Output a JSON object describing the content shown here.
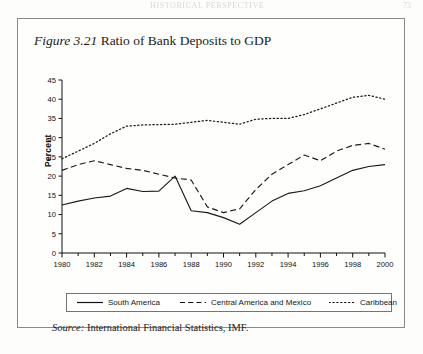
{
  "page": {
    "running_head": "HISTORICAL  PERSPECTIVE",
    "page_number": "73"
  },
  "figure": {
    "label": "Figure 3.21",
    "title": "Ratio of Bank Deposits to GDP",
    "source_label": "Source:",
    "source_text": "International Financial Statistics, IMF."
  },
  "legend": {
    "items": [
      {
        "label": "South America",
        "style": "solid",
        "key": "line-solid-key"
      },
      {
        "label": "Central America and Mexico",
        "style": "dashed",
        "key": "line-dashed-key"
      },
      {
        "label": "Caribbean",
        "style": "dotted",
        "key": "line-dotted-key"
      }
    ]
  },
  "chart_data": {
    "type": "line",
    "title": "Ratio of Bank Deposits to GDP",
    "xlabel": "",
    "ylabel": "Percent",
    "xlim": [
      1980,
      2000
    ],
    "ylim": [
      0,
      45
    ],
    "ytick_step": 5,
    "yticks": [
      0,
      5,
      10,
      15,
      20,
      25,
      30,
      35,
      40,
      45
    ],
    "xticks": [
      1980,
      1982,
      1984,
      1986,
      1988,
      1990,
      1992,
      1994,
      1996,
      1998,
      2000
    ],
    "xtick_labels": [
      "1980",
      "1982",
      "1984",
      "1986",
      "1988",
      "1990",
      "1992",
      "1994",
      "1996",
      "1998",
      "2000"
    ],
    "xtick_minor_every": 1,
    "grid": false,
    "legend_position": "below-axes",
    "x": [
      1980,
      1981,
      1982,
      1983,
      1984,
      1985,
      1986,
      1987,
      1988,
      1989,
      1990,
      1991,
      1992,
      1993,
      1994,
      1995,
      1996,
      1997,
      1998,
      1999,
      2000
    ],
    "series": [
      {
        "name": "South America",
        "style": "solid",
        "color": "#1a1a1a",
        "values": [
          12.5,
          13.5,
          14.3,
          14.8,
          16.8,
          16.0,
          16.1,
          20.0,
          11.0,
          10.5,
          9.2,
          7.5,
          10.5,
          13.5,
          15.5,
          16.2,
          17.5,
          19.5,
          21.5,
          22.5,
          23.0
        ]
      },
      {
        "name": "Central America and Mexico",
        "style": "dashed",
        "color": "#1a1a1a",
        "values": [
          21.5,
          23.0,
          24.0,
          23.0,
          22.0,
          21.5,
          20.5,
          19.5,
          19.0,
          12.0,
          10.5,
          11.5,
          16.5,
          20.5,
          23.0,
          25.5,
          24.0,
          26.5,
          28.0,
          28.5,
          27.0
        ]
      },
      {
        "name": "Caribbean",
        "style": "dotted",
        "color": "#1a1a1a",
        "values": [
          24.5,
          26.5,
          28.5,
          31.0,
          33.0,
          33.3,
          33.4,
          33.5,
          34.0,
          34.5,
          34.0,
          33.5,
          34.8,
          35.0,
          35.0,
          36.0,
          37.5,
          39.0,
          40.5,
          41.0,
          40.0
        ]
      }
    ]
  }
}
